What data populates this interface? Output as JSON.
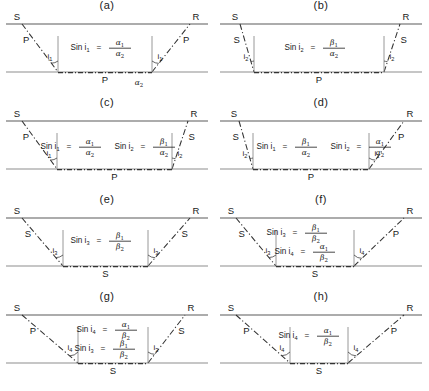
{
  "figure": {
    "type": "seismic-ray-path-diagram",
    "columns": 2,
    "rows": 4,
    "symbols": {
      "source": "S",
      "receiver": "R",
      "p_wave": "P",
      "s_wave": "S",
      "upper_p_velocity": "α₁",
      "upper_s_velocity": "β₁",
      "lower_p_velocity": "α₂",
      "lower_s_velocity": "β₂"
    }
  },
  "panels": [
    {
      "id": "a",
      "title": "(a)",
      "source_label": "S",
      "receiver_label": "R",
      "down_leg_label": "P",
      "up_leg_label": "P",
      "head_wave_label": "P",
      "lower_medium_label": "α",
      "lower_medium_sub": "2",
      "angle_left": "i",
      "angle_left_sub": "1",
      "angle_right": "i",
      "angle_right_sub": "1",
      "equations": [
        {
          "lhs": "Sin i",
          "lhs_sub": "1",
          "num": "α",
          "num_sub": "1",
          "den": "α",
          "den_sub": "2"
        }
      ]
    },
    {
      "id": "b",
      "title": "(b)",
      "source_label": "S",
      "receiver_label": "R",
      "down_leg_label": "S",
      "up_leg_label": "S",
      "head_wave_label": "P",
      "lower_medium_label": "",
      "lower_medium_sub": "",
      "angle_left": "i",
      "angle_left_sub": "2",
      "angle_right": "i",
      "angle_right_sub": "2",
      "equations": [
        {
          "lhs": "Sin i",
          "lhs_sub": "2",
          "num": "β",
          "num_sub": "1",
          "den": "α",
          "den_sub": "2"
        }
      ]
    },
    {
      "id": "c",
      "title": "(c)",
      "source_label": "S",
      "receiver_label": "R",
      "down_leg_label": "P",
      "up_leg_label": "S",
      "head_wave_label": "P",
      "lower_medium_label": "",
      "lower_medium_sub": "",
      "angle_left": "i",
      "angle_left_sub": "1",
      "angle_right": "i",
      "angle_right_sub": "2",
      "equations": [
        {
          "lhs": "Sin i",
          "lhs_sub": "1",
          "num": "α",
          "num_sub": "1",
          "den": "α",
          "den_sub": "2"
        },
        {
          "lhs": "Sin i",
          "lhs_sub": "2",
          "num": "β",
          "num_sub": "1",
          "den": "α",
          "den_sub": "2"
        }
      ]
    },
    {
      "id": "d",
      "title": "(d)",
      "source_label": "S",
      "receiver_label": "R",
      "down_leg_label": "S",
      "up_leg_label": "P",
      "head_wave_label": "P",
      "lower_medium_label": "",
      "lower_medium_sub": "",
      "angle_left": "i",
      "angle_left_sub": "2",
      "angle_right": "i",
      "angle_right_sub": "1",
      "equations": [
        {
          "lhs": "Sin i",
          "lhs_sub": "1",
          "num": "β",
          "num_sub": "1",
          "den": "α",
          "den_sub": "2"
        },
        {
          "lhs": "Sin i",
          "lhs_sub": "2",
          "num": "α",
          "num_sub": "1",
          "den": "α",
          "den_sub": "2"
        }
      ]
    },
    {
      "id": "e",
      "title": "(e)",
      "source_label": "S",
      "receiver_label": "R",
      "down_leg_label": "S",
      "up_leg_label": "S",
      "head_wave_label": "S",
      "lower_medium_label": "",
      "lower_medium_sub": "",
      "angle_left": "i",
      "angle_left_sub": "3",
      "angle_right": "i",
      "angle_right_sub": "3",
      "equations": [
        {
          "lhs": "Sin i",
          "lhs_sub": "3",
          "num": "β",
          "num_sub": "1",
          "den": "β",
          "den_sub": "2"
        }
      ]
    },
    {
      "id": "f",
      "title": "(f)",
      "source_label": "S",
      "receiver_label": "R",
      "down_leg_label": "S",
      "up_leg_label": "P",
      "head_wave_label": "S",
      "lower_medium_label": "",
      "lower_medium_sub": "",
      "angle_left": "i",
      "angle_left_sub": "3",
      "angle_right": "i",
      "angle_right_sub": "4",
      "equations": [
        {
          "lhs": "Sin i",
          "lhs_sub": "3",
          "num": "β",
          "num_sub": "1",
          "den": "β",
          "den_sub": "2"
        },
        {
          "lhs": "Sin i",
          "lhs_sub": "4",
          "num": "α",
          "num_sub": "1",
          "den": "β",
          "den_sub": "2"
        }
      ]
    },
    {
      "id": "g",
      "title": "(g)",
      "source_label": "S",
      "receiver_label": "R",
      "down_leg_label": "P",
      "up_leg_label": "S",
      "head_wave_label": "S",
      "lower_medium_label": "",
      "lower_medium_sub": "",
      "angle_left": "i",
      "angle_left_sub": "4",
      "angle_right": "i",
      "angle_right_sub": "3",
      "equations": [
        {
          "lhs": "Sin i",
          "lhs_sub": "4",
          "num": "α",
          "num_sub": "1",
          "den": "β",
          "den_sub": "2"
        },
        {
          "lhs": "Sin i",
          "lhs_sub": "3",
          "num": "β",
          "num_sub": "1",
          "den": "β",
          "den_sub": "2"
        }
      ]
    },
    {
      "id": "h",
      "title": "(h)",
      "source_label": "S",
      "receiver_label": "R",
      "down_leg_label": "P",
      "up_leg_label": "P",
      "head_wave_label": "S",
      "lower_medium_label": "",
      "lower_medium_sub": "",
      "angle_left": "i",
      "angle_left_sub": "4",
      "angle_right": "i",
      "angle_right_sub": "4",
      "equations": [
        {
          "lhs": "Sin i",
          "lhs_sub": "4",
          "num": "α",
          "num_sub": "1",
          "den": "β",
          "den_sub": "2"
        }
      ]
    }
  ]
}
